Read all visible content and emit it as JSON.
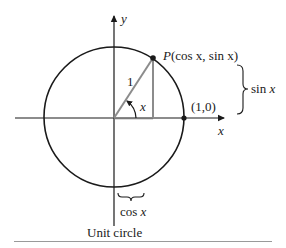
{
  "figure": {
    "caption": "Unit circle",
    "axes": {
      "x_label": "x",
      "y_label": "y"
    },
    "point_p": {
      "name": "P",
      "coords_text": "(cos x, sin x)"
    },
    "point_one_zero": {
      "label": "(1,0)"
    },
    "radius_label": "1",
    "angle_label": "x",
    "sin_brace": {
      "label_func": "sin",
      "label_var": "x"
    },
    "cos_brace": {
      "label_func": "cos",
      "label_var": "x"
    },
    "colors": {
      "ink": "#1a1a1a",
      "radius_line": "#8c8c8c",
      "rule": "#9a9a9a"
    }
  }
}
